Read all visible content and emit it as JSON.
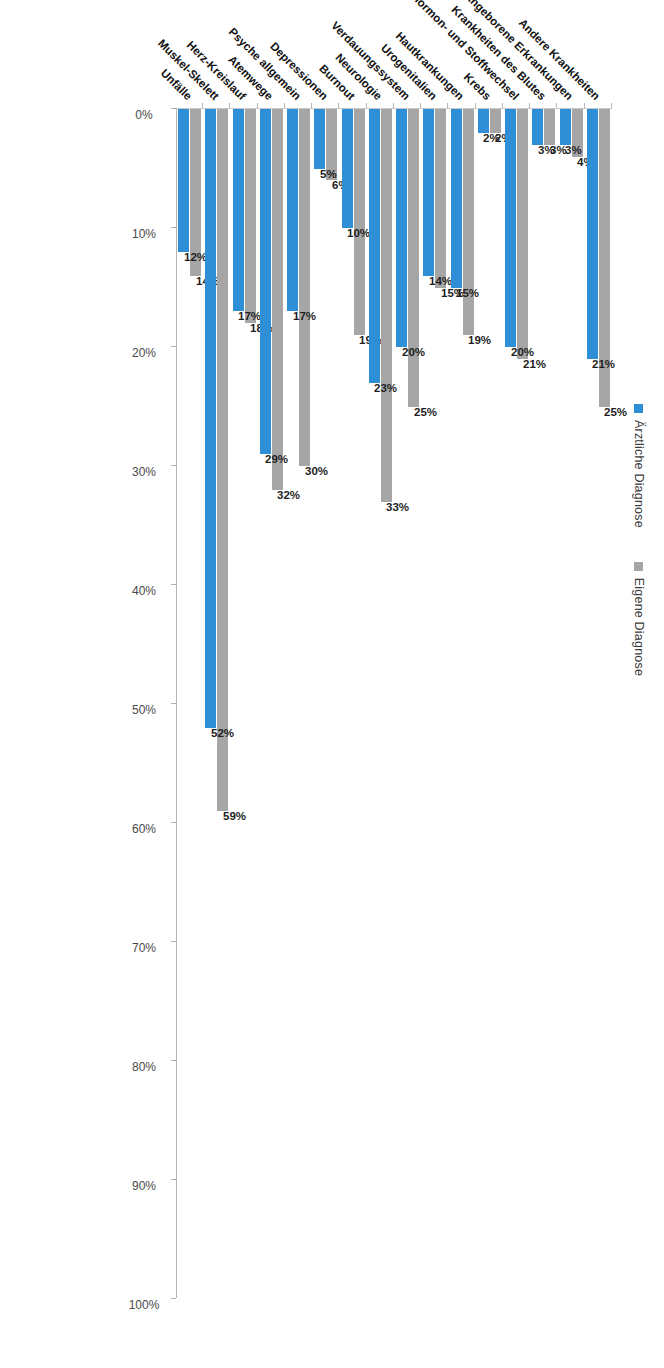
{
  "legend": {
    "entries": [
      {
        "label": "Ärztliche Diagnose",
        "color": "#2e8fd6",
        "key": "arzt"
      },
      {
        "label": "Eigene Diagnose",
        "color": "#a6a6a6",
        "key": "eigen"
      }
    ]
  },
  "axis": {
    "tick_labels": [
      "0%",
      "10%",
      "20%",
      "30%",
      "40%",
      "50%",
      "60%",
      "70%",
      "80%",
      "90%",
      "100%"
    ],
    "min": 0,
    "max": 100,
    "step": 10
  },
  "chart_data": {
    "type": "bar",
    "title": "",
    "subtitle": "",
    "xlabel": "",
    "ylabel": "",
    "orientation": "horizontal",
    "grid": false,
    "legend_position": "top",
    "ylim": [
      0,
      100
    ],
    "axis_tick_labels": [
      "0%",
      "10%",
      "20%",
      "30%",
      "40%",
      "50%",
      "60%",
      "70%",
      "80%",
      "90%",
      "100%"
    ],
    "categories": [
      "Unfälle",
      "Muskel-Skelett",
      "Herz-Kreislauf",
      "Atemwege",
      "Psyche allgemein",
      "Depressionen",
      "Burnout",
      "Neurologie",
      "Verdauungssystem",
      "Urogenitalien",
      "Hautkrankungen",
      "Krebs",
      "Hormon- und Stoffwechsel",
      "Krankheiten des Blutes",
      "Angeborene Erkrankungen",
      "Andere Krankheiten"
    ],
    "series": [
      {
        "name": "Ärztliche Diagnose",
        "color": "#2e8fd6",
        "values": [
          12,
          52,
          17,
          29,
          17,
          5,
          10,
          23,
          20,
          14,
          15,
          2,
          20,
          3,
          3,
          21
        ],
        "labels": [
          "12%",
          "52%",
          "17%",
          "29%",
          "17%",
          "5%",
          "10%",
          "23%",
          "20%",
          "14%",
          "15%",
          "2%",
          "20%",
          "3%",
          "3%",
          "21%"
        ]
      },
      {
        "name": "Eigene Diagnose",
        "color": "#a6a6a6",
        "values": [
          14,
          59,
          18,
          32,
          30,
          6,
          19,
          33,
          25,
          15,
          19,
          2,
          21,
          3,
          4,
          25
        ],
        "labels": [
          "14%",
          "59%",
          "18%",
          "32%",
          "30%",
          "6%",
          "19%",
          "33%",
          "25%",
          "15%",
          "19%",
          "2%",
          "21%",
          "3%",
          "4%",
          "25%"
        ]
      }
    ]
  }
}
